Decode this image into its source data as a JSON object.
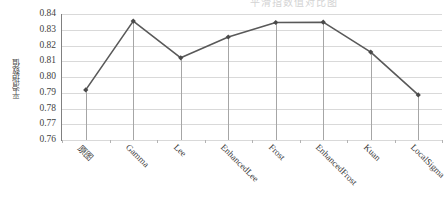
{
  "page": {
    "ghost_title": "平滑指数值对比图"
  },
  "chart_data": {
    "type": "line",
    "title": "",
    "xlabel": "",
    "ylabel": "平滑指数值",
    "categories": [
      "原图",
      "Gamma",
      "Lee",
      "EnhancedLee",
      "Frost",
      "EnhancedFrost",
      "Kuan",
      "LocalSigma"
    ],
    "values": [
      0.7918,
      0.8355,
      0.8122,
      0.8254,
      0.8346,
      0.8348,
      0.8158,
      0.7886
    ],
    "ylim": [
      0.76,
      0.84
    ],
    "yticks": [
      "0.84",
      "0.83",
      "0.82",
      "0.81",
      "0.80",
      "0.79",
      "0.78",
      "0.77",
      "0.76"
    ],
    "ytick_values": [
      0.84,
      0.83,
      0.82,
      0.81,
      0.8,
      0.79,
      0.78,
      0.77,
      0.76
    ],
    "grid": true,
    "legend": "none",
    "series": [
      {
        "name": "平滑指数值",
        "values": [
          0.7918,
          0.8355,
          0.8122,
          0.8254,
          0.8346,
          0.8348,
          0.8158,
          0.7886
        ]
      }
    ],
    "colors": {
      "line": "#595959",
      "marker": "#4a4a4a",
      "grid": "#d9d9d9",
      "axis": "#b3b3b3",
      "dropline": "#a6a6a6",
      "text": "#3a3a3a"
    }
  }
}
